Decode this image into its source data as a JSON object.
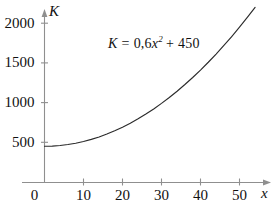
{
  "chart_data": {
    "type": "line",
    "title": "",
    "subtitle": "",
    "xlabel": "x",
    "ylabel": "K",
    "annotation": "K = 0,6x² + 450",
    "annotation_parts": {
      "lhs": "K",
      "equals": "=",
      "coefficient": "0,6",
      "variable": "x",
      "exponent": "2",
      "plus": "+",
      "constant": "450"
    },
    "formula": "K = 0.6*x^2 + 450",
    "grid": false,
    "legend": false,
    "xlim": [
      0,
      55
    ],
    "ylim": [
      0,
      2300
    ],
    "xticks": [
      0,
      10,
      20,
      30,
      40,
      50
    ],
    "xtick_labels": [
      "0",
      "10",
      "20",
      "30",
      "40",
      "50"
    ],
    "yticks": [
      500,
      1000,
      1500,
      2000
    ],
    "ytick_labels": [
      "500",
      "1000",
      "1500",
      "2000"
    ],
    "series": [
      {
        "name": "K = 0,6x² + 450",
        "x": [
          0,
          2,
          4,
          6,
          8,
          10,
          12,
          14,
          16,
          18,
          20,
          22,
          24,
          26,
          28,
          30,
          32,
          34,
          36,
          38,
          40,
          42,
          44,
          46,
          48,
          50,
          52,
          54
        ],
        "values": [
          450,
          452.4,
          459.6,
          471.6,
          488.4,
          510,
          536.4,
          567.6,
          603.6,
          644.4,
          690,
          740.4,
          795.6,
          855.6,
          920.4,
          990,
          1064.4,
          1143.6,
          1227.6,
          1316.4,
          1410,
          1508.4,
          1611.6,
          1719.6,
          1832.4,
          1950,
          2072.4,
          2199.6
        ]
      }
    ]
  },
  "axes": {
    "y_axis_name": "K",
    "x_axis_name": "x",
    "y_arrow": "arrow-up",
    "x_arrow": "arrow-right"
  },
  "colors": {
    "background": "#ffffff",
    "axis": "#8f8f8f",
    "curve": "#2b2b2b",
    "text": "#111111"
  }
}
